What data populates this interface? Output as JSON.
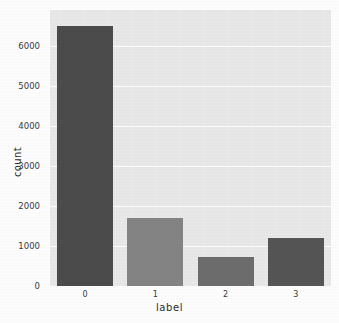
{
  "chart_data": {
    "type": "bar",
    "title": "",
    "xlabel": "label",
    "ylabel": "count",
    "categories": [
      "0",
      "1",
      "2",
      "3"
    ],
    "values": [
      6500,
      1700,
      720,
      1200
    ],
    "bar_colors": [
      "#4c4c4c",
      "#858585",
      "#6e6e6e",
      "#565656"
    ],
    "ylim": [
      0,
      6900
    ],
    "yticks": [
      0,
      1000,
      2000,
      3000,
      4000,
      5000,
      6000
    ],
    "ytick_labels": [
      "0",
      "1000",
      "2000",
      "3000",
      "4000",
      "5000",
      "6000"
    ],
    "xtick_labels": [
      "0",
      "1",
      "2",
      "3"
    ],
    "grid": "horizontal",
    "legend": "none",
    "plot_background": "#eaeaea",
    "gridline_color": "#ffffff",
    "figure_background": "#ffffff",
    "bars": [
      {
        "category": "0",
        "value": 6500,
        "color": "#4c4c4c"
      },
      {
        "category": "1",
        "value": 1700,
        "color": "#858585"
      },
      {
        "category": "2",
        "value": 720,
        "color": "#6e6e6e"
      },
      {
        "category": "3",
        "value": 1200,
        "color": "#565656"
      }
    ]
  }
}
